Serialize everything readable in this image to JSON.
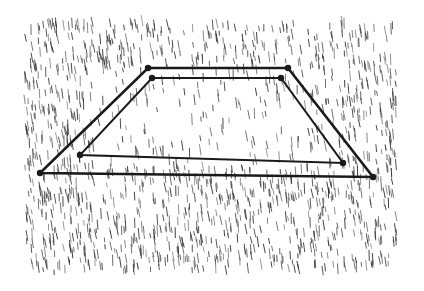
{
  "image": {
    "subject": "Pen-and-ink sketch of a rectangular quadrat frame lying on grass",
    "style": "hatched ink illustration",
    "colors": {
      "background": "#ffffff",
      "ink": "#1a1a1a",
      "grass": "#2b2b2b"
    },
    "frame": {
      "outer": [
        [
          148,
          68
        ],
        [
          288,
          68
        ],
        [
          373,
          177
        ],
        [
          40,
          173
        ]
      ],
      "inner": [
        [
          152,
          78
        ],
        [
          281,
          78
        ],
        [
          343,
          163
        ],
        [
          80,
          155
        ]
      ]
    },
    "grass_region": {
      "x": 25,
      "y": 25,
      "width": 372,
      "height": 250
    }
  }
}
